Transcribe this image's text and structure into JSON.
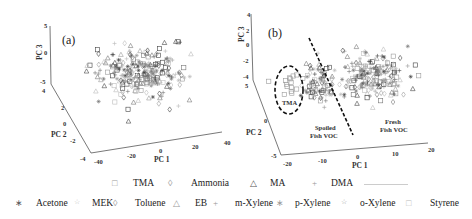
{
  "chart_data": [
    {
      "type": "scatter",
      "panel_label": "(a)",
      "projection": "3d",
      "axes": {
        "x": {
          "label": "PC 1",
          "ticks": [
            "-40",
            "-20",
            "0",
            "20",
            "40"
          ],
          "range": [
            -40,
            40
          ]
        },
        "y": {
          "label": "PC 2",
          "ticks": [
            "-4",
            "-2",
            "0",
            "2",
            "4"
          ],
          "range": [
            -4,
            4
          ]
        },
        "z": {
          "label": "PC 3",
          "ticks": [
            "-5",
            "0",
            "5"
          ],
          "range": [
            -5,
            5
          ]
        }
      },
      "grid": false,
      "description": "PCA scores of all 12 VOCs overlapping in a single cloud, centred near PC1 = -5, PC2 = 0, PC3 = 0"
    },
    {
      "type": "scatter",
      "panel_label": "(b)",
      "projection": "3d",
      "axes": {
        "x": {
          "label": "PC 1",
          "ticks": [
            "-20",
            "-10",
            "0",
            "10",
            "20"
          ],
          "range": [
            -20,
            20
          ]
        },
        "y": {
          "label": "PC 2",
          "ticks": [
            "-5",
            "0",
            "5"
          ],
          "range": [
            -5,
            5
          ]
        },
        "z": {
          "label": "PC 3",
          "ticks": [
            "-4",
            "-3",
            "-2",
            "0",
            "2",
            "4"
          ],
          "range": [
            -4,
            4
          ]
        }
      },
      "grid": false,
      "annotations": [
        {
          "text": "TMA",
          "type": "dashed-ellipse",
          "position": "left cluster"
        },
        {
          "text": "Spoiled Fish VOC",
          "position": "left of dashed separator"
        },
        {
          "text": "Fresh Fish VOC",
          "position": "right of dashed separator"
        },
        {
          "type": "dashed-line",
          "description": "separator between spoiled and fresh fish VOC clusters"
        }
      ]
    }
  ],
  "legend": {
    "row1": [
      {
        "symbol": "□",
        "label": "TMA"
      },
      {
        "symbol": "◊",
        "label": "Ammonia"
      },
      {
        "symbol": "△",
        "label": "MA"
      },
      {
        "symbol": "+",
        "label": "DMA"
      }
    ],
    "row2": [
      {
        "symbol": "∗",
        "label": "Acetone"
      },
      {
        "symbol": "☆",
        "label": "MEK"
      },
      {
        "symbol": "◊",
        "label": "Toluene"
      },
      {
        "symbol": "△",
        "label": "EB"
      },
      {
        "symbol": "+",
        "label": "m-Xylene"
      },
      {
        "symbol": "∗",
        "label": "p-Xylene"
      },
      {
        "symbol": "☆",
        "label": "o-Xylene"
      },
      {
        "symbol": "□",
        "label": "Styrene"
      }
    ]
  },
  "colors": {
    "axis": "#555555",
    "marker_dark": "#444444",
    "marker_light": "#9a9a9a",
    "dashed": "#111111"
  }
}
